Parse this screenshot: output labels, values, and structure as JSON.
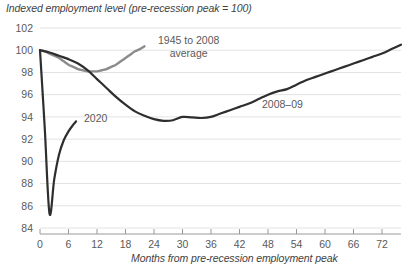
{
  "chart_data": {
    "type": "line",
    "title": "Indexed employment level (pre-recession peak = 100)",
    "xlabel": "Months from pre-recession employment peak",
    "ylabel": "",
    "xlim": [
      0,
      76
    ],
    "ylim": [
      84,
      102
    ],
    "yticks": [
      84,
      86,
      88,
      90,
      92,
      94,
      96,
      98,
      100,
      102
    ],
    "xticks": [
      0,
      6,
      12,
      18,
      24,
      30,
      36,
      42,
      48,
      54,
      60,
      66,
      72
    ],
    "grid": "horizontal",
    "legend": "inline-annotations",
    "series": [
      {
        "name": "1945 to 2008 average",
        "color": "#8c8c8c",
        "label_position": "top-center",
        "x": [
          0,
          1,
          2,
          3,
          4,
          5,
          6,
          7,
          8,
          9,
          10,
          11,
          12,
          13,
          14,
          15,
          16,
          17,
          18,
          19,
          20,
          21,
          22
        ],
        "values": [
          100.0,
          99.9,
          99.7,
          99.5,
          99.3,
          99.0,
          98.7,
          98.5,
          98.3,
          98.2,
          98.1,
          98.1,
          98.1,
          98.2,
          98.3,
          98.5,
          98.7,
          99.0,
          99.3,
          99.6,
          99.9,
          100.1,
          100.35
        ]
      },
      {
        "name": "2020",
        "color": "#2e2e2e",
        "label_position": "right-of-curve",
        "x": [
          0,
          1,
          2,
          3,
          4,
          5,
          6,
          7,
          7.6
        ],
        "values": [
          100.0,
          93.0,
          85.3,
          88.4,
          90.6,
          91.9,
          92.7,
          93.3,
          93.6
        ]
      },
      {
        "name": "2008–09",
        "color": "#2e2e2e",
        "label_position": "above-curve-right",
        "x": [
          0,
          2,
          4,
          6,
          8,
          10,
          12,
          14,
          16,
          18,
          20,
          22,
          24,
          26,
          28,
          30,
          32,
          34,
          36,
          38,
          40,
          42,
          44,
          46,
          48,
          50,
          52,
          54,
          56,
          58,
          60,
          62,
          64,
          66,
          68,
          70,
          72,
          74,
          76
        ],
        "values": [
          100.0,
          99.8,
          99.5,
          99.2,
          98.8,
          98.2,
          97.4,
          96.6,
          95.8,
          95.1,
          94.5,
          94.1,
          93.8,
          93.65,
          93.7,
          94.0,
          93.95,
          93.9,
          94.0,
          94.3,
          94.6,
          94.9,
          95.2,
          95.6,
          96.0,
          96.3,
          96.5,
          96.9,
          97.3,
          97.6,
          97.9,
          98.2,
          98.5,
          98.8,
          99.1,
          99.4,
          99.7,
          100.1,
          100.5
        ]
      }
    ]
  },
  "labels": {
    "series_avg_line1": "1945 to 2008",
    "series_avg_line2": "average",
    "series_2020": "2020",
    "series_2008": "2008–09"
  }
}
